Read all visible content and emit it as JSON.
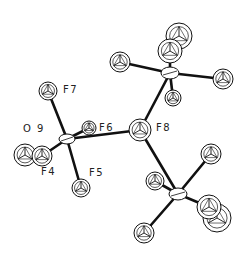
{
  "diagram": {
    "type": "ORTEP molecular structure",
    "colors": {
      "line": "#111111",
      "atom_fill": "#ffffff",
      "label": "#222222"
    },
    "labels": [
      {
        "id": "F7",
        "text": "F7",
        "x": 63,
        "y": 85
      },
      {
        "id": "O9",
        "text": "O 9",
        "x": 23,
        "y": 124
      },
      {
        "id": "F6",
        "text": "F6",
        "x": 99,
        "y": 123
      },
      {
        "id": "F8",
        "text": "F8",
        "x": 156,
        "y": 123
      },
      {
        "id": "F4",
        "text": "F4",
        "x": 41,
        "y": 167
      },
      {
        "id": "F5",
        "text": "F5",
        "x": 89,
        "y": 168
      }
    ],
    "atoms": [
      {
        "id": "P1",
        "x": 67,
        "y": 139,
        "r": 6,
        "kind": "central"
      },
      {
        "id": "F7",
        "x": 48,
        "y": 91,
        "r": 9,
        "kind": "F"
      },
      {
        "id": "F6",
        "x": 89,
        "y": 128,
        "r": 7,
        "kind": "F"
      },
      {
        "id": "F5",
        "x": 81,
        "y": 188,
        "r": 9,
        "kind": "F"
      },
      {
        "id": "O9",
        "x": 25,
        "y": 155,
        "r": 11,
        "kind": "F"
      },
      {
        "id": "F4",
        "x": 42,
        "y": 156,
        "r": 10,
        "kind": "F"
      },
      {
        "id": "F8",
        "x": 140,
        "y": 130,
        "r": 11,
        "kind": "F"
      },
      {
        "id": "P2",
        "x": 170,
        "y": 73,
        "r": 7,
        "kind": "central"
      },
      {
        "id": "P2_top1",
        "x": 179,
        "y": 36,
        "r": 13,
        "kind": "F"
      },
      {
        "id": "P2_top2",
        "x": 170,
        "y": 51,
        "r": 12,
        "kind": "F"
      },
      {
        "id": "P2_left",
        "x": 120,
        "y": 62,
        "r": 10,
        "kind": "F"
      },
      {
        "id": "P2_right",
        "x": 223,
        "y": 79,
        "r": 10,
        "kind": "F"
      },
      {
        "id": "P2_bottom",
        "x": 173,
        "y": 98,
        "r": 8,
        "kind": "F"
      },
      {
        "id": "P3",
        "x": 178,
        "y": 194,
        "r": 7,
        "kind": "central"
      },
      {
        "id": "P3_ur",
        "x": 211,
        "y": 154,
        "r": 10,
        "kind": "F"
      },
      {
        "id": "P3_l",
        "x": 155,
        "y": 181,
        "r": 9,
        "kind": "F"
      },
      {
        "id": "P3_ll",
        "x": 144,
        "y": 233,
        "r": 10,
        "kind": "F"
      },
      {
        "id": "P3_r2",
        "x": 217,
        "y": 218,
        "r": 14,
        "kind": "F"
      },
      {
        "id": "P3_r1",
        "x": 209,
        "y": 207,
        "r": 12,
        "kind": "F"
      }
    ],
    "bonds": [
      [
        "P1",
        "F7"
      ],
      [
        "P1",
        "F6"
      ],
      [
        "P1",
        "F5"
      ],
      [
        "P1",
        "F4"
      ],
      [
        "P1",
        "F8"
      ],
      [
        "F8",
        "P2"
      ],
      [
        "P2",
        "P2_top2"
      ],
      [
        "P2",
        "P2_left"
      ],
      [
        "P2",
        "P2_right"
      ],
      [
        "P2",
        "P2_bottom"
      ],
      [
        "F8",
        "P3"
      ],
      [
        "P3",
        "P3_ur"
      ],
      [
        "P3",
        "P3_l"
      ],
      [
        "P3",
        "P3_ll"
      ],
      [
        "P3",
        "P3_r1"
      ]
    ]
  }
}
